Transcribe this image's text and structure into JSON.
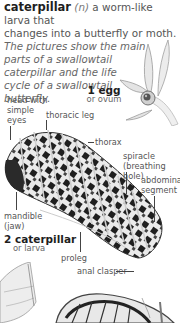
{
  "entry": {
    "headword": "caterpillar",
    "part_of_speech": "(n)",
    "definition_line1": " a worm-like larva that",
    "definition_line2": "changes into a butterfly or moth.",
    "description_lines": [
      "The pictures show the main",
      "parts of a swallowtail",
      "caterpillar and the life",
      "cycle of a swallowtail",
      "butterfly."
    ]
  },
  "stages": [
    {
      "number_name": "1 egg",
      "subtitle": "or ovum"
    },
    {
      "number_name": "2 caterpillar",
      "subtitle": "or larva"
    }
  ],
  "labels": {
    "head": [
      "head with",
      "simple",
      "eyes"
    ],
    "thoracic_leg": "thoracic leg",
    "thorax": "thorax",
    "spiracle": [
      "spiracle",
      "(breathing hole)"
    ],
    "abdominal_segment": [
      "abdominal",
      "segment"
    ],
    "mandible": [
      "mandible",
      "(jaw)"
    ],
    "proleg": "proleg",
    "anal_clasper": "anal clasper"
  },
  "colors": {
    "text_dark": "#1e1e1e",
    "text_body": "#555555",
    "illustration_dark": "#222222",
    "illustration_light": "#e6e6e6"
  }
}
